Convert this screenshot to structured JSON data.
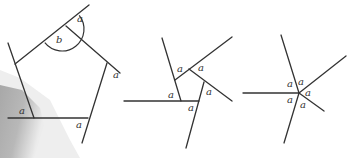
{
  "diagram": {
    "title": "",
    "colors": {
      "line": "#333333",
      "shade_dark": "#a8a8a8",
      "shade_light": "#dcdcdc"
    },
    "figures": [
      {
        "name": "pentagon-with-extended-sides",
        "vertices": [
          [
            15,
            64
          ],
          [
            66,
            26
          ],
          [
            107,
            63
          ],
          [
            88,
            118
          ],
          [
            34,
            118
          ]
        ],
        "lines": [
          [
            [
              15,
              64
            ],
            [
              89,
              5
            ]
          ],
          [
            [
              8,
              43
            ],
            [
              34,
              118
            ]
          ],
          [
            [
              8,
              118
            ],
            [
              88,
              118
            ]
          ],
          [
            [
              66,
              26
            ],
            [
              120,
              73
            ]
          ],
          [
            [
              107,
              63
            ],
            [
              82,
              143
            ]
          ]
        ],
        "arc": {
          "center": [
            62,
            29
          ],
          "radius": 22
        },
        "labels": [
          {
            "text": "a",
            "x": 77,
            "y": 22
          },
          {
            "text": "b",
            "x": 56,
            "y": 43
          },
          {
            "text": "a",
            "x": 113,
            "y": 78
          },
          {
            "text": "a",
            "x": 19,
            "y": 114
          },
          {
            "text": "a",
            "x": 76,
            "y": 128
          }
        ]
      },
      {
        "name": "small-pentagon-with-extended-sides",
        "vertices": [
          [
            175,
            80
          ],
          [
            189,
            69
          ],
          [
            204,
            82
          ],
          [
            198,
            101
          ],
          [
            181,
            101
          ]
        ],
        "lines": [
          [
            [
              162,
              38
            ],
            [
              181,
              101
            ]
          ],
          [
            [
              175,
              80
            ],
            [
              232,
              37
            ]
          ],
          [
            [
              189,
              69
            ],
            [
              232,
              101
            ]
          ],
          [
            [
              204,
              82
            ],
            [
              186,
              148
            ]
          ],
          [
            [
              124,
              101
            ],
            [
              199,
              101
            ]
          ]
        ],
        "labels": [
          {
            "text": "a",
            "x": 177,
            "y": 72
          },
          {
            "text": "a",
            "x": 198,
            "y": 71
          },
          {
            "text": "a",
            "x": 168,
            "y": 98
          },
          {
            "text": "a",
            "x": 206,
            "y": 95
          },
          {
            "text": "a",
            "x": 188,
            "y": 111
          }
        ]
      },
      {
        "name": "five-lines-through-point",
        "center": [
          299,
          93
        ],
        "lines": [
          [
            [
              299,
              93
            ],
            [
              281,
              35
            ]
          ],
          [
            [
              299,
              93
            ],
            [
              346,
              56
            ]
          ],
          [
            [
              299,
              93
            ],
            [
              243,
              93
            ]
          ],
          [
            [
              299,
              93
            ],
            [
              324,
              111
            ]
          ],
          [
            [
              299,
              93
            ],
            [
              284,
              143
            ]
          ]
        ],
        "labels": [
          {
            "text": "a",
            "x": 287,
            "y": 87
          },
          {
            "text": "a",
            "x": 298,
            "y": 85
          },
          {
            "text": "a",
            "x": 305,
            "y": 96
          },
          {
            "text": "a",
            "x": 287,
            "y": 103
          },
          {
            "text": "a",
            "x": 300,
            "y": 108
          }
        ]
      }
    ]
  }
}
